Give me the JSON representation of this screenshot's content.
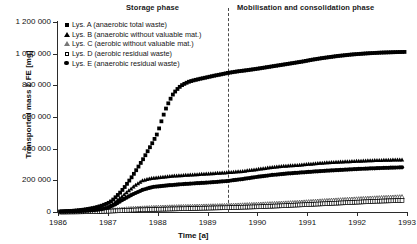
{
  "titles": {
    "storage_phase": "Storage phase",
    "mobilisation_phase": "Mobilisation and consolidation phase"
  },
  "axes": {
    "ylabel": "Transported mass Σ FE [mg]",
    "xlabel": "Time [a]",
    "yticks": [
      "0",
      "200 000",
      "400 000",
      "600 000",
      "800 000",
      "1 000 000",
      "1 200 000"
    ],
    "ytick_values": [
      0,
      200000,
      400000,
      600000,
      800000,
      1000000,
      1200000
    ],
    "xticks": [
      "1986",
      "1987",
      "1988",
      "1989",
      "1990",
      "1991",
      "1992",
      "1993"
    ],
    "xtick_values": [
      1986,
      1987,
      1988,
      1989,
      1990,
      1991,
      1992,
      1993
    ]
  },
  "legend": [
    {
      "marker": "filled-square",
      "label": "Lys. A (anaerobic total waste)"
    },
    {
      "marker": "filled-triangle",
      "label": "Lys. B (anaerobic without valuable mat.)"
    },
    {
      "marker": "open-triangle",
      "label": "Lys. C (aerobic without valuable mat.)"
    },
    {
      "marker": "open-square",
      "label": "Lys. D (aerobic residual waste)"
    },
    {
      "marker": "filled-circle",
      "label": "Lys. E (anaerobic residual waste)"
    }
  ],
  "annotations": {
    "phase_divider_x": 1989.4
  },
  "chart_data": {
    "type": "scatter",
    "title": "",
    "xlabel": "Time [a]",
    "ylabel": "Transported mass Σ FE [mg]",
    "xlim": [
      1986,
      1993
    ],
    "ylim": [
      0,
      1200000
    ],
    "grid": false,
    "legend_position": "upper-left",
    "phase_divider_x": 1989.4,
    "series": [
      {
        "name": "Lys. A (anaerobic total waste)",
        "marker": "filled-square",
        "x": [
          1986.05,
          1986.2,
          1986.35,
          1986.5,
          1986.62,
          1986.75,
          1986.88,
          1987.0,
          1987.08,
          1987.16,
          1987.24,
          1987.32,
          1987.4,
          1987.5,
          1987.6,
          1987.7,
          1987.8,
          1987.9,
          1988.0,
          1988.06,
          1988.12,
          1988.18,
          1988.24,
          1988.3,
          1988.36,
          1988.42,
          1988.48,
          1988.55,
          1988.62,
          1988.7,
          1988.78,
          1988.86,
          1988.95,
          1989.05,
          1989.15,
          1989.25,
          1989.4,
          1989.6,
          1989.8,
          1990.0,
          1990.3,
          1990.6,
          1990.9,
          1991.1,
          1991.3,
          1991.6,
          1991.9,
          1992.2,
          1992.5,
          1992.8,
          1992.95
        ],
        "y": [
          2000,
          5000,
          9000,
          14000,
          20000,
          28000,
          40000,
          55000,
          70000,
          95000,
          120000,
          150000,
          185000,
          230000,
          280000,
          330000,
          385000,
          440000,
          500000,
          560000,
          615000,
          665000,
          705000,
          740000,
          765000,
          785000,
          800000,
          812000,
          822000,
          830000,
          836000,
          842000,
          848000,
          855000,
          862000,
          868000,
          878000,
          888000,
          896000,
          905000,
          920000,
          935000,
          950000,
          962000,
          972000,
          985000,
          995000,
          1002000,
          1007000,
          1010000,
          1011000
        ]
      },
      {
        "name": "Lys. B (anaerobic without valuable mat.)",
        "marker": "filled-triangle",
        "x": [
          1986.05,
          1986.3,
          1986.6,
          1986.85,
          1987.0,
          1987.12,
          1987.25,
          1987.4,
          1987.55,
          1987.7,
          1987.9,
          1988.1,
          1988.3,
          1988.5,
          1988.7,
          1988.9,
          1989.1,
          1989.3,
          1989.5,
          1989.7,
          1989.9,
          1990.1,
          1990.3,
          1990.5,
          1990.8,
          1991.0,
          1991.2,
          1991.4,
          1991.7,
          1992.0,
          1992.3,
          1992.6,
          1992.9
        ],
        "y": [
          1500,
          4000,
          9000,
          18000,
          30000,
          55000,
          90000,
          130000,
          170000,
          200000,
          215000,
          222000,
          228000,
          232000,
          236000,
          240000,
          244000,
          248000,
          252000,
          258000,
          266000,
          275000,
          283000,
          290000,
          296000,
          302000,
          308000,
          313000,
          318000,
          322000,
          326000,
          329000,
          331000
        ]
      },
      {
        "name": "Lys. C (aerobic without valuable mat.)",
        "marker": "open-triangle",
        "x": [
          1986.05,
          1986.4,
          1986.8,
          1987.0,
          1987.2,
          1987.4,
          1987.7,
          1988.0,
          1988.4,
          1988.8,
          1989.2,
          1989.6,
          1990.0,
          1990.4,
          1990.8,
          1991.1,
          1991.4,
          1991.8,
          1992.2,
          1992.6,
          1992.9
        ],
        "y": [
          500,
          1500,
          4000,
          8000,
          14000,
          20000,
          25000,
          29000,
          33000,
          36000,
          39000,
          43000,
          48000,
          54000,
          60000,
          66000,
          72000,
          79000,
          86000,
          92000,
          96000
        ]
      },
      {
        "name": "Lys. D (aerobic residual waste)",
        "marker": "open-square",
        "x": [
          1986.05,
          1986.4,
          1986.8,
          1987.0,
          1987.3,
          1987.6,
          1988.0,
          1988.4,
          1988.8,
          1989.2,
          1989.6,
          1990.0,
          1990.4,
          1990.8,
          1991.2,
          1991.6,
          1992.0,
          1992.4,
          1992.9
        ],
        "y": [
          300,
          900,
          2500,
          5000,
          9000,
          13000,
          17000,
          20000,
          23000,
          26000,
          29000,
          33000,
          38000,
          44000,
          50000,
          56000,
          62000,
          68000,
          73000
        ]
      },
      {
        "name": "Lys. E (anaerobic residual waste)",
        "marker": "filled-circle",
        "x": [
          1986.05,
          1986.3,
          1986.6,
          1986.85,
          1987.0,
          1987.15,
          1987.3,
          1987.5,
          1987.7,
          1987.9,
          1988.2,
          1988.5,
          1988.8,
          1989.1,
          1989.4,
          1989.7,
          1990.0,
          1990.3,
          1990.6,
          1990.9,
          1991.2,
          1991.5,
          1991.8,
          1992.1,
          1992.5,
          1992.9
        ],
        "y": [
          1200,
          3500,
          8000,
          16000,
          26000,
          48000,
          78000,
          112000,
          140000,
          158000,
          168000,
          176000,
          182000,
          188000,
          196000,
          208000,
          222000,
          234000,
          243000,
          250000,
          257000,
          263000,
          268000,
          273000,
          278000,
          282000
        ]
      }
    ]
  }
}
